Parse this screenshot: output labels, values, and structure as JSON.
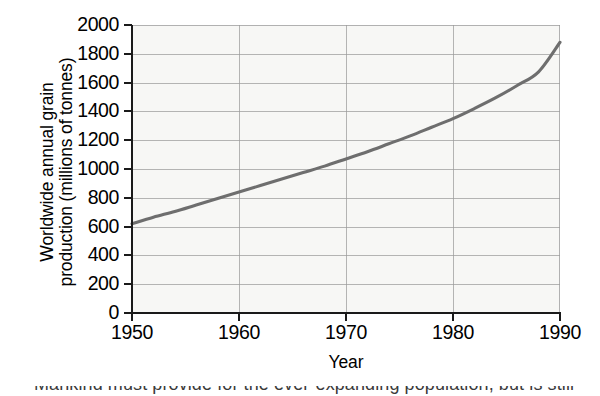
{
  "chart_data": {
    "type": "line",
    "title": "",
    "xlabel": "Year",
    "ylabel": "Worldwide annual grain production (millions of tonnes)",
    "ylabel_lines": [
      "Worldwide annual grain",
      "production (millions of tonnes)"
    ],
    "xlim": [
      1950,
      1990
    ],
    "ylim": [
      0,
      2000
    ],
    "xticks": [
      1950,
      1960,
      1970,
      1980,
      1990
    ],
    "xtick_labels": [
      "1950",
      "1960",
      "1970",
      "1980",
      "1990"
    ],
    "yticks": [
      0,
      200,
      400,
      600,
      800,
      1000,
      1200,
      1400,
      1600,
      1800,
      2000
    ],
    "ytick_labels": [
      "0",
      "200",
      "400",
      "600",
      "800",
      "1000",
      "1200",
      "1400",
      "1600",
      "1800",
      "2000"
    ],
    "grid": true,
    "legend": "none",
    "series": [
      {
        "name": "Worldwide annual grain production",
        "color": "#6e6e6e",
        "x": [
          1950,
          1952,
          1954,
          1956,
          1958,
          1960,
          1962,
          1964,
          1966,
          1968,
          1970,
          1972,
          1974,
          1976,
          1978,
          1980,
          1982,
          1984,
          1986,
          1988,
          1990
        ],
        "values": [
          620,
          665,
          705,
          750,
          795,
          840,
          885,
          930,
          975,
          1020,
          1070,
          1120,
          1175,
          1230,
          1290,
          1350,
          1420,
          1495,
          1580,
          1675,
          1880
        ]
      }
    ]
  },
  "colors": {
    "line": "#6e6e6e",
    "axis": "#1a1a1a",
    "grid": "#9a9a9a",
    "panel_background": "#f7f7f5",
    "page_background": "#ffffff",
    "text": "#000000"
  },
  "caption": {
    "cut_off_text": "Mankind must provide for the ever-expanding population, but is still"
  }
}
